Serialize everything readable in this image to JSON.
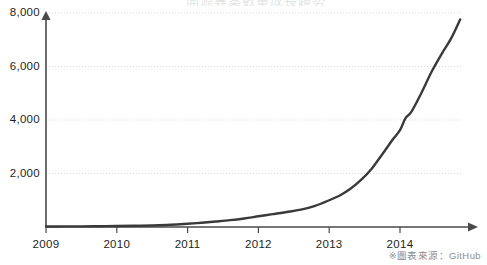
{
  "figure": {
    "background_color": "#ffffff",
    "clipped_header_text": "開源專案數量成長趨勢",
    "source_note": "※圖表來源：GitHub"
  },
  "axes": {
    "line_color": "#3a3a3a",
    "gridline_color": "#d8d8d8",
    "axis_color": "#4a4a4a",
    "tick_text_color": "#1d1f22"
  },
  "chart_data": {
    "type": "line",
    "title": "",
    "subtitle": "",
    "xlabel": "",
    "ylabel": "",
    "xlim": [
      2009,
      2014.9
    ],
    "ylim": [
      0,
      8000
    ],
    "grid": true,
    "grid_axis": "y",
    "legend": "none",
    "line_color": "#3a3a3a",
    "line_width": 2.4,
    "markers": false,
    "x_tick_labels": [
      "2009",
      "2010",
      "2011",
      "2012",
      "2013",
      "2014"
    ],
    "x_tick_values": [
      2009,
      2010,
      2011,
      2012,
      2013,
      2014
    ],
    "y_tick_labels": [
      "2,000",
      "4,000",
      "6,000",
      "8,000"
    ],
    "y_tick_values": [
      2000,
      4000,
      6000,
      8000
    ],
    "series": [
      {
        "name": "Repositories",
        "x": [
          2009.0,
          2009.25,
          2009.5,
          2009.75,
          2010.0,
          2010.25,
          2010.5,
          2010.7,
          2010.85,
          2011.0,
          2011.2,
          2011.4,
          2011.6,
          2011.8,
          2012.0,
          2012.2,
          2012.4,
          2012.6,
          2012.8,
          2013.0,
          2013.15,
          2013.3,
          2013.45,
          2013.6,
          2013.75,
          2013.9,
          2014.0,
          2014.08,
          2014.16,
          2014.3,
          2014.45,
          2014.6,
          2014.72,
          2014.85
        ],
        "values": [
          20,
          22,
          25,
          30,
          35,
          45,
          58,
          75,
          95,
          120,
          160,
          205,
          255,
          320,
          400,
          480,
          560,
          650,
          790,
          1000,
          1180,
          1430,
          1760,
          2180,
          2720,
          3280,
          3620,
          4080,
          4300,
          5000,
          5820,
          6520,
          7040,
          7760
        ]
      }
    ]
  }
}
